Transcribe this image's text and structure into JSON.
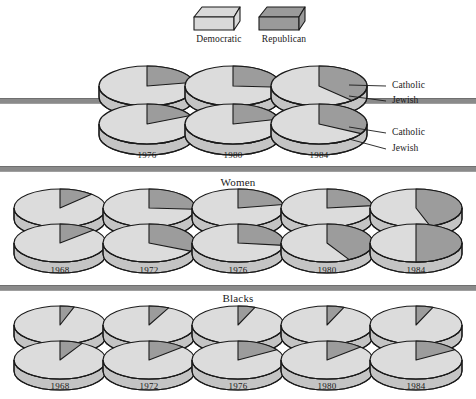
{
  "legend": {
    "items": [
      {
        "label": "Democratic",
        "color": "#d9d9d9",
        "icon": "cube-3d-icon",
        "x": 190
      },
      {
        "label": "Republican",
        "color": "#9a9a9a",
        "icon": "cube-3d-icon",
        "x": 255
      }
    ]
  },
  "colors": {
    "democratic": "#dcdcdc",
    "democratic_side": "#c4c4c4",
    "republican": "#9c9c9c",
    "republican_side": "#8a8a8a",
    "outline": "#1a1a1a",
    "rule": "#8a8a8a"
  },
  "sections": [
    {
      "name": "religion",
      "title": "",
      "rule_top_y": 98,
      "rule_bottom_y": 166,
      "years": [
        "1976",
        "1980",
        "1984"
      ],
      "year_label_y": 150,
      "rows": [
        {
          "name": "Catholic",
          "republican_share": [
            0.22,
            0.26,
            0.38
          ]
        },
        {
          "name": "Jewish",
          "republican_share": [
            0.18,
            0.21,
            0.33
          ]
        }
      ],
      "annotations": [
        {
          "label": "Catholic",
          "row": 0
        },
        {
          "label": "Jewish",
          "row": 0
        },
        {
          "label": "Catholic",
          "row": 1
        },
        {
          "label": "Jewish",
          "row": 1
        }
      ]
    },
    {
      "name": "women",
      "title": "Women",
      "rule_top_y": 166,
      "rule_bottom_y": 285,
      "title_y": 176,
      "years": [
        "1968",
        "1972",
        "1976",
        "1980",
        "1984"
      ],
      "year_label_y": 265,
      "rows": [
        {
          "name": "top",
          "republican_share": [
            0.12,
            0.26,
            0.22,
            0.23,
            0.45
          ]
        },
        {
          "name": "bottom",
          "republican_share": [
            0.13,
            0.32,
            0.27,
            0.42,
            0.5
          ]
        }
      ]
    },
    {
      "name": "blacks",
      "title": "Blacks",
      "rule_top_y": 285,
      "rule_bottom_y": 399,
      "title_y": 292,
      "years": [
        "1968",
        "1972",
        "1976",
        "1980",
        "1984"
      ],
      "year_label_y": 381,
      "rows": [
        {
          "name": "top",
          "republican_share": [
            0.05,
            0.07,
            0.06,
            0.06,
            0.06
          ]
        },
        {
          "name": "bottom",
          "republican_share": [
            0.08,
            0.13,
            0.16,
            0.13,
            0.16
          ]
        }
      ]
    }
  ],
  "chart_data": {
    "type": "pie",
    "legend": [
      "Democratic",
      "Republican"
    ],
    "legend_position": "top-center",
    "note": "Each 3-D disc is a pie chart; value given is the Republican share of the two-party vote.",
    "groups": [
      {
        "group": "Catholic",
        "years": [
          "1976",
          "1980",
          "1984"
        ],
        "series": [
          {
            "name": "Democratic",
            "values": [
              0.78,
              0.74,
              0.62
            ]
          },
          {
            "name": "Republican",
            "values": [
              0.22,
              0.26,
              0.38
            ]
          }
        ]
      },
      {
        "group": "Jewish",
        "years": [
          "1976",
          "1980",
          "1984"
        ],
        "series": [
          {
            "name": "Democratic",
            "values": [
              0.82,
              0.79,
              0.67
            ]
          },
          {
            "name": "Republican",
            "values": [
              0.18,
              0.21,
              0.33
            ]
          }
        ]
      },
      {
        "group": "Women (upper row)",
        "years": [
          "1968",
          "1972",
          "1976",
          "1980",
          "1984"
        ],
        "series": [
          {
            "name": "Democratic",
            "values": [
              0.88,
              0.74,
              0.78,
              0.77,
              0.55
            ]
          },
          {
            "name": "Republican",
            "values": [
              0.12,
              0.26,
              0.22,
              0.23,
              0.45
            ]
          }
        ]
      },
      {
        "group": "Women (lower row)",
        "years": [
          "1968",
          "1972",
          "1976",
          "1980",
          "1984"
        ],
        "series": [
          {
            "name": "Democratic",
            "values": [
              0.87,
              0.68,
              0.73,
              0.58,
              0.5
            ]
          },
          {
            "name": "Republican",
            "values": [
              0.13,
              0.32,
              0.27,
              0.42,
              0.5
            ]
          }
        ]
      },
      {
        "group": "Blacks (upper row)",
        "years": [
          "1968",
          "1972",
          "1976",
          "1980",
          "1984"
        ],
        "series": [
          {
            "name": "Democratic",
            "values": [
              0.95,
              0.93,
              0.94,
              0.94,
              0.94
            ]
          },
          {
            "name": "Republican",
            "values": [
              0.05,
              0.07,
              0.06,
              0.06,
              0.06
            ]
          }
        ]
      },
      {
        "group": "Blacks (lower row)",
        "years": [
          "1968",
          "1972",
          "1976",
          "1980",
          "1984"
        ],
        "series": [
          {
            "name": "Democratic",
            "values": [
              0.92,
              0.87,
              0.84,
              0.87,
              0.84
            ]
          },
          {
            "name": "Republican",
            "values": [
              0.08,
              0.13,
              0.16,
              0.13,
              0.16
            ]
          }
        ]
      }
    ]
  }
}
